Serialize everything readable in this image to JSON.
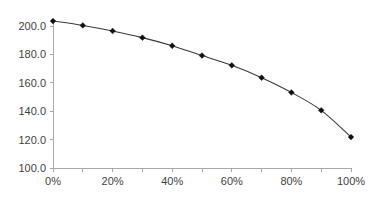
{
  "chart_data": {
    "type": "line",
    "title": "",
    "subtitle": "",
    "xlabel": "",
    "ylabel": "",
    "x": [
      0,
      10,
      20,
      30,
      40,
      50,
      60,
      70,
      80,
      90,
      100
    ],
    "x_tick_labels": [
      "0%",
      "20%",
      "40%",
      "60%",
      "80%",
      "100%"
    ],
    "x_tick_values": [
      0,
      20,
      40,
      60,
      80,
      100
    ],
    "x_minor_tick_values": [
      0,
      10,
      20,
      30,
      40,
      50,
      60,
      70,
      80,
      90,
      100
    ],
    "xlim": [
      0,
      100
    ],
    "y_tick_labels": [
      "100.0",
      "120.0",
      "140.0",
      "160.0",
      "180.0",
      "200.0"
    ],
    "y_tick_values": [
      100,
      120,
      140,
      160,
      180,
      200
    ],
    "ylim": [
      100,
      210
    ],
    "grid": false,
    "legend": false,
    "legend_position": "none",
    "marker": "diamond",
    "series": [
      {
        "name": "series-1",
        "color": "#333333",
        "values": [
          203.5,
          200.4,
          196.5,
          191.8,
          186.1,
          179.2,
          172.3,
          163.6,
          153.2,
          140.6,
          121.8
        ]
      }
    ]
  },
  "axes": {
    "y_axis_name": "value-axis",
    "x_axis_name": "percent-axis"
  }
}
